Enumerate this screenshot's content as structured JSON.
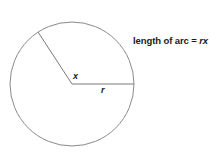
{
  "diagram": {
    "circle": {
      "cx": 72,
      "cy": 84,
      "r": 62,
      "stroke": "#8a8a8a",
      "stroke_width": 1
    },
    "radius_lines": [
      {
        "x1": 72,
        "y1": 84,
        "x2": 134,
        "y2": 84,
        "stroke": "#7a7a7a"
      },
      {
        "x1": 72,
        "y1": 84,
        "x2": 38,
        "y2": 32,
        "stroke": "#7a7a7a"
      }
    ],
    "labels": {
      "angle": "x",
      "radius": "r",
      "formula_prefix": "length of arc = ",
      "formula_var": "rx"
    }
  }
}
